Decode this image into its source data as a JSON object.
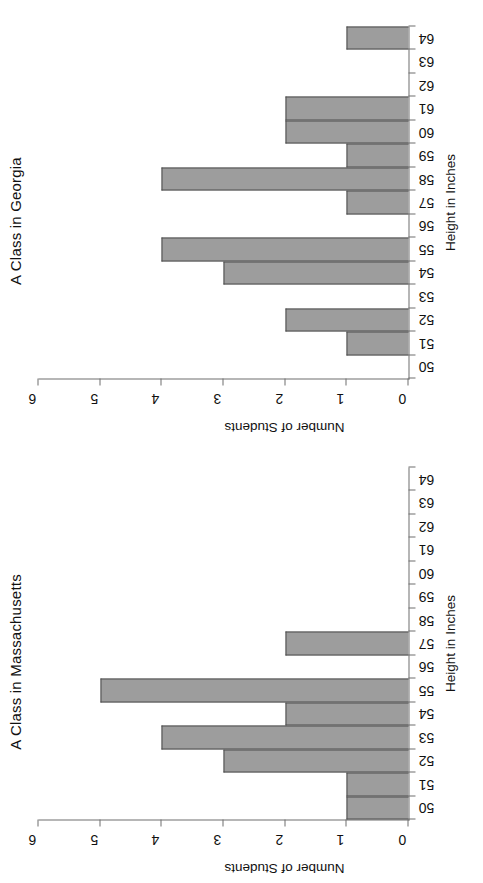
{
  "page": {
    "title": "Two Class Height Histograms"
  },
  "axis_titles": {
    "value": "Number of Students",
    "category": "Height in Inches"
  },
  "style": {
    "bar_fill": "#9d9d9d",
    "bar_stroke": "#4e4e4e",
    "axis_color": "#6f6f6f",
    "text_color": "#111111",
    "background": "#ffffff"
  },
  "chart_data": [
    {
      "id": "georgia",
      "type": "bar",
      "title": "A Class in Georgia",
      "xlabel": "Height in Inches",
      "ylabel": "Number of Students",
      "ylim": [
        0,
        6
      ],
      "yticks": [
        0,
        1,
        2,
        3,
        4,
        5,
        6
      ],
      "grid": false,
      "legend": "none",
      "orientation": "rotated-90-ccw",
      "categories": [
        "50",
        "51",
        "52",
        "53",
        "54",
        "55",
        "56",
        "57",
        "58",
        "59",
        "60",
        "61",
        "62",
        "63",
        "64"
      ],
      "values": [
        0,
        1,
        2,
        0,
        3,
        4,
        0,
        1,
        4,
        1,
        2,
        2,
        0,
        0,
        1
      ],
      "total_students": 21
    },
    {
      "id": "massachusetts",
      "type": "bar",
      "title": "A Class in Massachusetts",
      "xlabel": "Height in Inches",
      "ylabel": "Number of Students",
      "ylim": [
        0,
        6
      ],
      "yticks": [
        0,
        1,
        2,
        3,
        4,
        5,
        6
      ],
      "grid": false,
      "legend": "none",
      "orientation": "rotated-90-ccw",
      "categories": [
        "50",
        "51",
        "52",
        "53",
        "54",
        "55",
        "56",
        "57",
        "58",
        "59",
        "60",
        "61",
        "62",
        "63",
        "64"
      ],
      "values": [
        1,
        1,
        3,
        4,
        2,
        5,
        0,
        2,
        0,
        0,
        0,
        0,
        0,
        0,
        0
      ],
      "total_students": 18
    }
  ]
}
